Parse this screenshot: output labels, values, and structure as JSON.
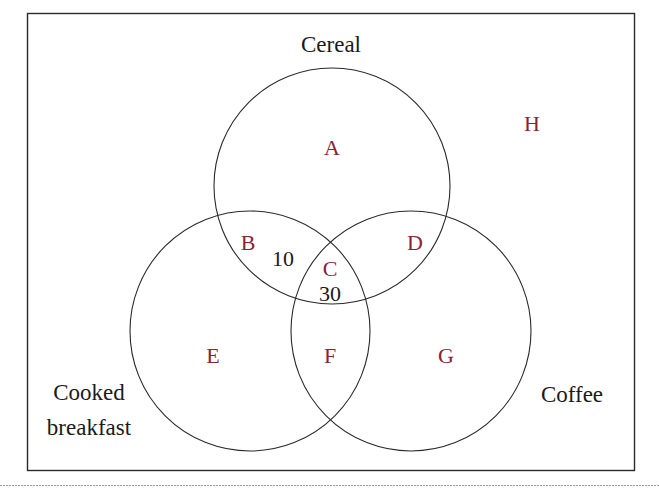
{
  "diagram": {
    "type": "venn-3",
    "label_color": "#8B2332",
    "text_color": "#1a1a1a",
    "line_color": "#2a2a2a",
    "sets": [
      {
        "name": "Cereal",
        "cx": 332,
        "cy": 186,
        "r": 118
      },
      {
        "name": "Cooked breakfast",
        "line1": "Cooked",
        "line2": "breakfast",
        "cx": 250,
        "cy": 331,
        "r": 120
      },
      {
        "name": "Coffee",
        "cx": 411,
        "cy": 331,
        "r": 120
      }
    ],
    "regions": [
      {
        "id": "A",
        "label": "A",
        "description": "Cereal only",
        "x": 332,
        "y": 155
      },
      {
        "id": "B",
        "label": "B",
        "description": "Cereal and Cooked breakfast only",
        "x": 248,
        "y": 250,
        "count": "10",
        "count_x": 283,
        "count_y": 266
      },
      {
        "id": "C",
        "label": "C",
        "description": "All three",
        "x": 330,
        "y": 276,
        "count": "30",
        "count_x": 330,
        "count_y": 301
      },
      {
        "id": "D",
        "label": "D",
        "description": "Cereal and Coffee only",
        "x": 415,
        "y": 250
      },
      {
        "id": "E",
        "label": "E",
        "description": "Cooked breakfast only",
        "x": 213,
        "y": 363
      },
      {
        "id": "F",
        "label": "F",
        "description": "Cooked breakfast and Coffee only",
        "x": 330,
        "y": 363
      },
      {
        "id": "G",
        "label": "G",
        "description": "Coffee only",
        "x": 446,
        "y": 363
      },
      {
        "id": "H",
        "label": "H",
        "description": "None",
        "x": 532,
        "y": 131
      }
    ]
  }
}
